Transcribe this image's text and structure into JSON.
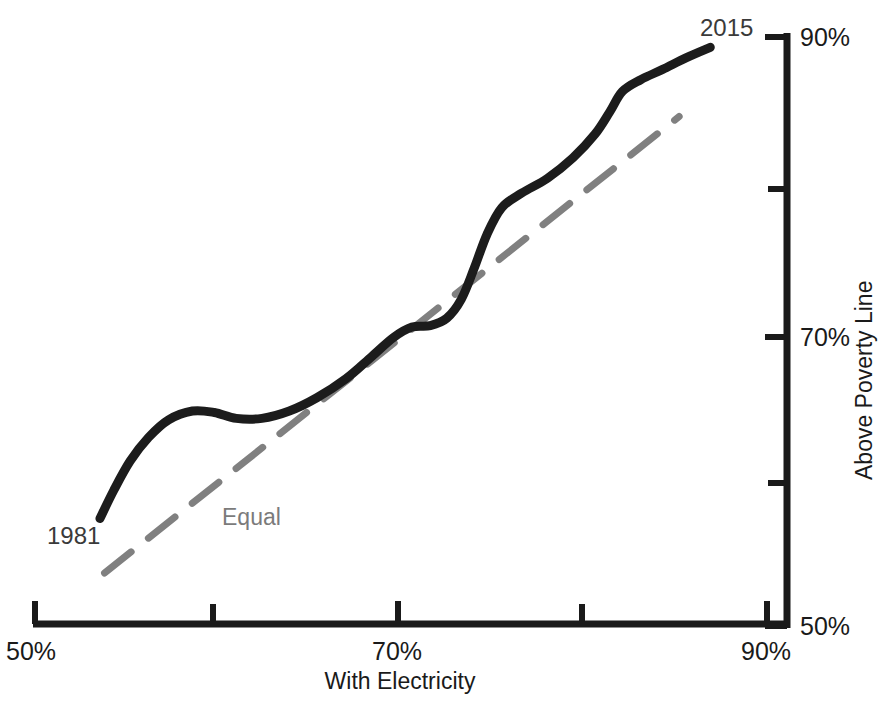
{
  "chart_data": {
    "type": "line",
    "title": "",
    "subtitle": "",
    "xlabel": "With Electricity",
    "ylabel": "Above Poverty Line",
    "xlim": [
      50,
      90
    ],
    "ylim": [
      50,
      90
    ],
    "x_major_ticks": [
      "50%",
      "70%",
      "90%"
    ],
    "x_minor_ticks": [
      "60%",
      "80%"
    ],
    "y_major_ticks": [
      "50%",
      "70%",
      "90%"
    ],
    "y_minor_ticks": [
      "60%",
      "80%"
    ],
    "x_unit": "%",
    "y_unit": "%",
    "grid": false,
    "legend_position": "inline-annotations",
    "annotations": [
      {
        "text": "1981",
        "x": 53.5,
        "y": 59.0,
        "role": "series-start-label"
      },
      {
        "text": "2015",
        "x": 88.0,
        "y": 91.0,
        "role": "series-end-label"
      },
      {
        "text": "Equal",
        "x": 60.3,
        "y": 58.2,
        "role": "reference-line-label"
      }
    ],
    "series": [
      {
        "name": "Electricity vs Poverty trajectory",
        "style": "solid",
        "color": "#1c1c1c",
        "width": 9,
        "points": [
          {
            "x": 53.55,
            "y": 57.3
          },
          {
            "x": 54.3,
            "y": 59.2
          },
          {
            "x": 55.2,
            "y": 61.2
          },
          {
            "x": 56.2,
            "y": 62.8
          },
          {
            "x": 57.3,
            "y": 64.0
          },
          {
            "x": 58.6,
            "y": 64.6
          },
          {
            "x": 59.8,
            "y": 64.5
          },
          {
            "x": 61.0,
            "y": 64.1
          },
          {
            "x": 62.4,
            "y": 64.1
          },
          {
            "x": 63.9,
            "y": 64.6
          },
          {
            "x": 65.4,
            "y": 65.5
          },
          {
            "x": 67.0,
            "y": 66.8
          },
          {
            "x": 68.4,
            "y": 68.3
          },
          {
            "x": 69.6,
            "y": 69.6
          },
          {
            "x": 70.6,
            "y": 70.3
          },
          {
            "x": 71.6,
            "y": 70.4
          },
          {
            "x": 72.5,
            "y": 70.9
          },
          {
            "x": 73.3,
            "y": 72.2
          },
          {
            "x": 74.0,
            "y": 74.3
          },
          {
            "x": 74.7,
            "y": 76.6
          },
          {
            "x": 75.5,
            "y": 78.4
          },
          {
            "x": 76.6,
            "y": 79.4
          },
          {
            "x": 78.0,
            "y": 80.4
          },
          {
            "x": 79.4,
            "y": 81.8
          },
          {
            "x": 80.6,
            "y": 83.4
          },
          {
            "x": 81.4,
            "y": 84.9
          },
          {
            "x": 82.1,
            "y": 86.3
          },
          {
            "x": 83.1,
            "y": 87.1
          },
          {
            "x": 84.3,
            "y": 87.8
          },
          {
            "x": 85.6,
            "y": 88.6
          },
          {
            "x": 86.9,
            "y": 89.3
          }
        ]
      },
      {
        "name": "Equal",
        "style": "dashed",
        "color": "#808080",
        "width": 7,
        "points": [
          {
            "x": 53.8,
            "y": 53.6
          },
          {
            "x": 85.2,
            "y": 84.6
          }
        ]
      }
    ]
  },
  "axes": {
    "x_axis_name": "x-axis",
    "y_axis_name": "y-axis",
    "corner_label": "50%"
  }
}
